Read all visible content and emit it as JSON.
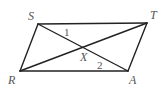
{
  "diagram": {
    "type": "parallelogram-with-diagonals",
    "stroke_color": "#222222",
    "label_color": "#555555",
    "vertices": {
      "S": {
        "label": "S",
        "x": 38,
        "y": 24
      },
      "T": {
        "label": "T",
        "x": 147,
        "y": 23
      },
      "A": {
        "label": "A",
        "x": 128,
        "y": 71
      },
      "R": {
        "label": "R",
        "x": 20,
        "y": 71
      }
    },
    "intersection": {
      "label": "X",
      "x": 83,
      "y": 47
    },
    "angle_labels": {
      "angle1": "1",
      "angle2": "2"
    },
    "sides": [
      "ST",
      "TA",
      "AR",
      "RS"
    ],
    "diagonals": [
      "SA",
      "RT"
    ]
  }
}
